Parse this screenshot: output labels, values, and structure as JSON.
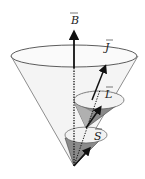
{
  "diagram": {
    "type": "vector-precession-cones",
    "labels": {
      "B": "B",
      "J": "J",
      "L": "L",
      "S": "S"
    },
    "colors": {
      "stroke": "#222222",
      "cone_shade": "#8a8a8a",
      "cone_light": "#e9e9e9",
      "background": "#ffffff"
    }
  }
}
